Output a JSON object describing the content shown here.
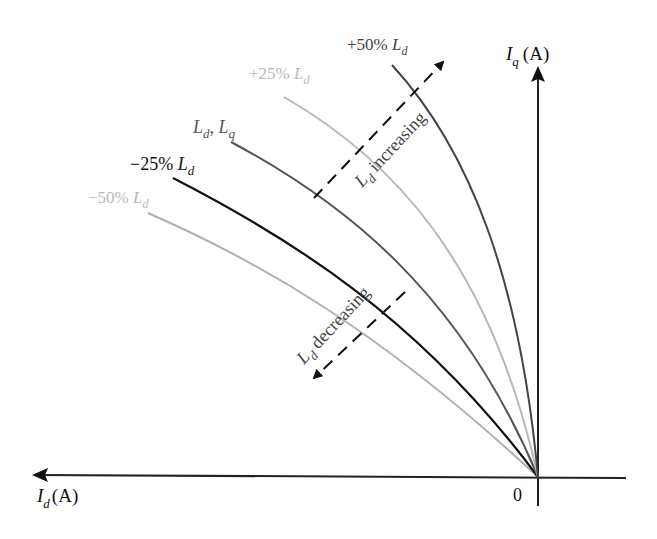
{
  "diagram": {
    "type": "MTPA trajectory curves vs. inductance variation",
    "axes": {
      "x_label_main": "I",
      "x_label_sub": "d",
      "x_label_unit": "(A)",
      "y_label_main": "I",
      "y_label_sub": "q",
      "y_label_unit": "(A)",
      "origin_label": "0"
    },
    "curves": [
      {
        "id": "minus50",
        "label_prefix": "−50% ",
        "label_main": "L",
        "label_sub": "d",
        "color": "#b0b0b0"
      },
      {
        "id": "minus25",
        "label_prefix": "−25% ",
        "label_main": "L",
        "label_sub": "d",
        "color": "#111111"
      },
      {
        "id": "nominal",
        "label_prefix": "",
        "label_main": "L",
        "label_sub": "d",
        "label_sep": ", ",
        "label_main2": "L",
        "label_sub2": "q",
        "color": "#555555"
      },
      {
        "id": "plus25",
        "label_prefix": "+25% ",
        "label_main": "L",
        "label_sub": "d",
        "color": "#b8b8b8"
      },
      {
        "id": "plus50",
        "label_prefix": "+50% ",
        "label_main": "L",
        "label_sub": "d",
        "color": "#444444"
      }
    ],
    "annotations": {
      "increasing": {
        "main": "L",
        "sub": "d",
        "text": " increasing"
      },
      "decreasing": {
        "main": "L",
        "sub": "d",
        "text": " decreasing"
      }
    }
  }
}
